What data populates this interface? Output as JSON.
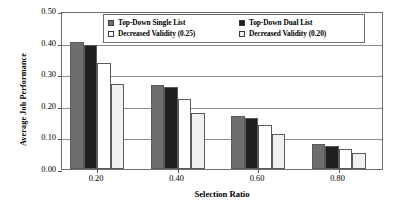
{
  "chart_data": {
    "type": "bar",
    "title": "",
    "xlabel": "Selection Ratio",
    "ylabel": "Average Job Performance",
    "categories": [
      "0.20",
      "0.40",
      "0.60",
      "0.80"
    ],
    "ylim": [
      0.0,
      0.5
    ],
    "yticks": [
      "0.00",
      "0.10",
      "0.20",
      "0.30",
      "0.40",
      "0.50"
    ],
    "ytick_values": [
      0.0,
      0.1,
      0.2,
      0.3,
      0.4,
      0.5
    ],
    "grid": true,
    "legend_position": "top-center",
    "series": [
      {
        "name": "Top-Down Single List",
        "color": "#6e6e6e",
        "values": [
          0.401,
          0.266,
          0.168,
          0.078
        ]
      },
      {
        "name": "Top-Down Dual List",
        "color": "#1f1f1f",
        "values": [
          0.394,
          0.26,
          0.163,
          0.074
        ]
      },
      {
        "name": "Decreased Validity (0.25)",
        "color": "#ffffff",
        "values": [
          0.335,
          0.22,
          0.139,
          0.064
        ]
      },
      {
        "name": "Decreased Validity (0.20)",
        "color": "#f0f0f0",
        "values": [
          0.268,
          0.177,
          0.11,
          0.051
        ]
      }
    ]
  }
}
